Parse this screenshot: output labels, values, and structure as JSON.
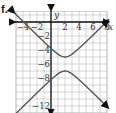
{
  "problem_label": "f.",
  "chart_data": {
    "type": "line",
    "title": "",
    "xlabel": "x",
    "ylabel": "y",
    "xlim": [
      -5,
      8
    ],
    "ylim": [
      -13,
      1.5
    ],
    "grid": true,
    "x_tick_labels": [
      "-4",
      "-2",
      "2",
      "4",
      "6",
      "8"
    ],
    "y_tick_labels": [
      "-2",
      "-4",
      "-6",
      "-8",
      "-12"
    ],
    "curve": "hyperbola (y+6)^2 - (x-2)^2 = 1",
    "center": [
      2,
      -6
    ],
    "vertices": [
      [
        2,
        -5
      ],
      [
        2,
        -7
      ]
    ],
    "asymptote_slopes": [
      1,
      -1
    ],
    "series": [
      {
        "name": "upper branch",
        "x": [
          -5,
          -2,
          0,
          2,
          4,
          6,
          8
        ],
        "y": [
          1.07,
          -1.88,
          -3.76,
          -5,
          -3.76,
          -1.88,
          0.08
        ]
      },
      {
        "name": "lower branch",
        "x": [
          -5,
          -2,
          0,
          2,
          4,
          6,
          8
        ],
        "y": [
          -13.07,
          -10.12,
          -8.24,
          -7,
          -8.24,
          -10.12,
          -12.08
        ]
      }
    ],
    "colors": {
      "curve": "#555555",
      "axes": "#111111",
      "grid": "#bbbbbb"
    }
  }
}
